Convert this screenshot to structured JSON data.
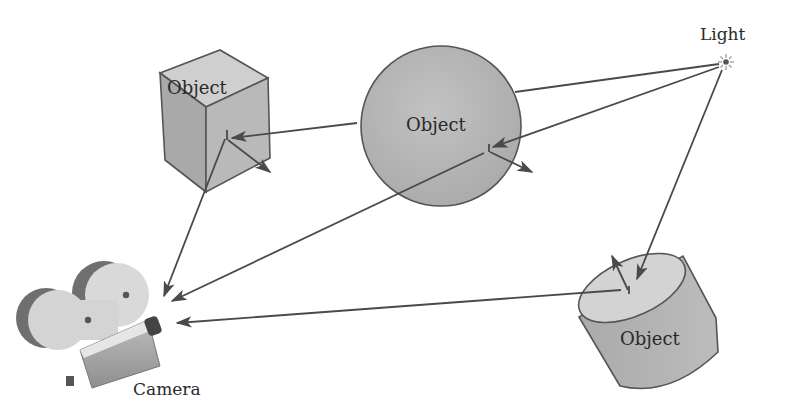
{
  "diagram": {
    "labels": {
      "light": "Light",
      "cube": "Object",
      "sphere": "Object",
      "cylinder": "Object",
      "camera": "Camera"
    },
    "nodes": [
      {
        "id": "light",
        "label": "Light",
        "shape": "sun-icon",
        "x": 722,
        "y": 62
      },
      {
        "id": "cube",
        "label": "Object",
        "shape": "cube",
        "x": 205,
        "y": 120
      },
      {
        "id": "sphere",
        "label": "Object",
        "shape": "sphere",
        "x": 440,
        "y": 120
      },
      {
        "id": "cylinder",
        "label": "Object",
        "shape": "cylinder",
        "x": 650,
        "y": 320
      },
      {
        "id": "camera",
        "label": "Camera",
        "shape": "movie-camera-icon",
        "x": 100,
        "y": 335
      }
    ],
    "edges": [
      {
        "from": "light",
        "to": "sphere",
        "note": "light ray grazing sphere top"
      },
      {
        "from": "light",
        "to": "sphere",
        "note": "light ray hitting sphere surface point"
      },
      {
        "from": "light",
        "to": "cylinder",
        "note": "light ray hitting cylinder top"
      },
      {
        "from": "sphere",
        "to": "cube",
        "note": "reflected ray to cube face"
      },
      {
        "from": "cube",
        "to": "camera",
        "note": "ray from cube to camera"
      },
      {
        "from": "sphere",
        "to": "camera",
        "note": "ray from sphere to camera"
      },
      {
        "from": "cylinder",
        "to": "camera",
        "note": "ray from cylinder to camera"
      }
    ],
    "colors": {
      "object_fill": "#b5b5b5",
      "object_light": "#d6d6d6",
      "object_dark": "#9a9a9a",
      "ray": "#4a4a4a",
      "background": "#ffffff"
    }
  }
}
